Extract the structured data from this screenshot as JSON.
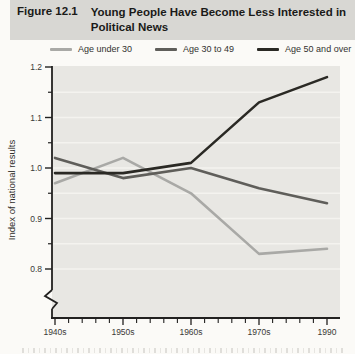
{
  "figure": {
    "label": "Figure 12.1",
    "title_line1": "Young People Have Become Less Interested in",
    "title_line2": "Political News"
  },
  "legend": {
    "items": [
      {
        "label": "Age under 30",
        "color": "#a9a9a6"
      },
      {
        "label": "Age 30 to 49",
        "color": "#5f5e5a"
      },
      {
        "label": "Age 50 and over",
        "color": "#2a2924"
      }
    ]
  },
  "chart_data": {
    "type": "line",
    "categories": [
      "1940s",
      "1950s",
      "1960s",
      "1970s",
      "1990"
    ],
    "series": [
      {
        "name": "Age under 30",
        "color": "#a9a9a6",
        "values": [
          0.97,
          1.02,
          0.95,
          0.83,
          0.84
        ]
      },
      {
        "name": "Age 30 to 49",
        "color": "#5f5e5a",
        "values": [
          1.02,
          0.98,
          1.0,
          0.96,
          0.93
        ]
      },
      {
        "name": "Age 50 and over",
        "color": "#2a2924",
        "values": [
          0.99,
          0.99,
          1.01,
          1.13,
          1.18
        ]
      }
    ],
    "ylabel": "Index of national results",
    "ylim": [
      0.75,
      1.2
    ],
    "yticks_major": [
      1.2,
      1.1,
      1.0,
      0.9,
      0.8
    ],
    "yticks_minor": [
      1.15,
      1.05,
      0.95,
      0.85
    ],
    "gridlines": [
      1.15,
      1.1,
      1.05,
      1.0,
      0.95,
      0.9,
      0.85,
      0.8
    ],
    "x_minor_divisions": 5,
    "axis_break": true,
    "legend_position": "top",
    "plot_bg": "#e8e7e3",
    "grid_color": "#f4f3ef",
    "axis_color": "#222120",
    "tick_label_color": "#3a3936"
  }
}
